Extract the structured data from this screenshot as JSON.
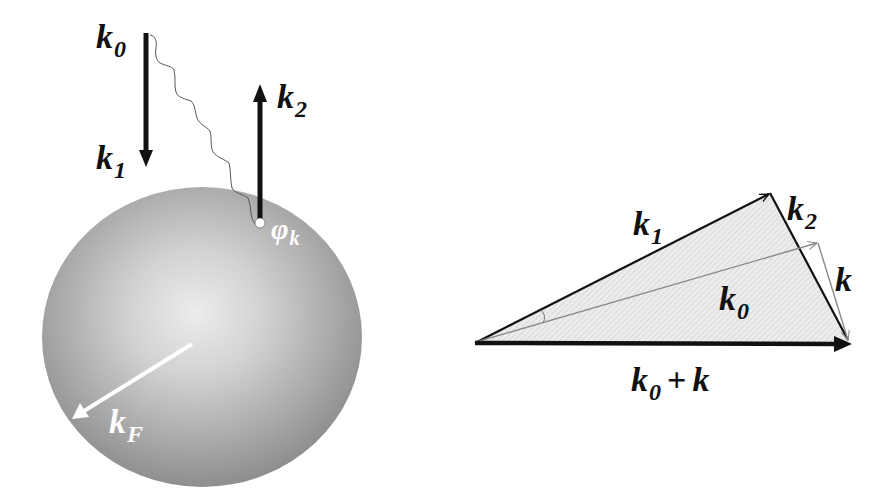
{
  "figure": {
    "left_panel": {
      "title": "Fermi sphere scattering",
      "labels": {
        "k0": {
          "main": "k",
          "sub": "0"
        },
        "k1": {
          "main": "k",
          "sub": "1"
        },
        "k2": {
          "main": "k",
          "sub": "2"
        },
        "phi_k": {
          "main": "φ",
          "sub": "k"
        },
        "kF": {
          "main": "k",
          "sub": "F"
        }
      },
      "sphere": {
        "cx": 202,
        "cy": 337,
        "rx": 160,
        "ry": 150,
        "center_color": "#ececec",
        "edge_color": "#8c8c8c"
      }
    },
    "right_panel": {
      "title": "Wavevector triangle",
      "labels": {
        "k1": {
          "main": "k",
          "sub": "1"
        },
        "k2": {
          "main": "k",
          "sub": "2"
        },
        "k": {
          "main": "k"
        },
        "k0": {
          "main": "k",
          "sub": "0"
        },
        "sum": {
          "a_main": "k",
          "a_sub": "0",
          "op": "+",
          "b_main": "k"
        }
      },
      "vertices": {
        "origin": [
          475,
          343
        ],
        "k1_tip": [
          770,
          193
        ],
        "k0_tip": [
          818,
          243
        ],
        "sum_tip": [
          850,
          344
        ]
      },
      "fill_color": "#e3e3e3",
      "line_color": "#111111",
      "gray_line_color": "#8a8a8a"
    }
  }
}
